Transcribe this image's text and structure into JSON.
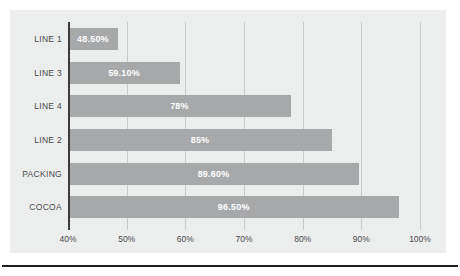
{
  "chart_data": {
    "type": "bar",
    "orientation": "horizontal",
    "title": "",
    "xlabel": "",
    "ylabel": "",
    "categories": [
      "LINE 1",
      "LINE 3",
      "LINE 4",
      "LINE 2",
      "PACKING",
      "COCOA"
    ],
    "values": [
      48.5,
      59.1,
      78,
      85,
      89.6,
      96.5
    ],
    "data_labels": [
      "48.50%",
      "59.10%",
      "78%",
      "85%",
      "89.60%",
      "96.50%"
    ],
    "xlim": [
      40,
      100
    ],
    "xticks": [
      40,
      50,
      60,
      70,
      80,
      90,
      100
    ],
    "xtick_labels": [
      "40%",
      "50%",
      "60%",
      "70%",
      "80%",
      "90%",
      "100%"
    ],
    "grid": true,
    "legend": false,
    "bar_color": "#a6a8aa",
    "data_label_color": "#ffffff",
    "plot_background": "#eceded",
    "axis_line_color": "#3c3c3c",
    "gridline_color": "#c9cbcb"
  }
}
